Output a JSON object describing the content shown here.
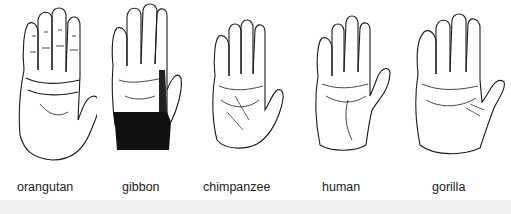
{
  "figure": {
    "hands": [
      {
        "id": "orangutan",
        "label": "orangutan",
        "x": 15,
        "label_x": 17
      },
      {
        "id": "gibbon",
        "label": "gibbon",
        "x": 105,
        "label_x": 122
      },
      {
        "id": "chimpanzee",
        "label": "chimpanzee",
        "x": 205,
        "label_x": 203
      },
      {
        "id": "human",
        "label": "human",
        "x": 308,
        "label_x": 322
      },
      {
        "id": "gorilla",
        "label": "gorilla",
        "x": 410,
        "label_x": 432
      }
    ],
    "colors": {
      "ink": "#1a1a1a",
      "background": "#ffffff",
      "strip": "#f0f0f0"
    }
  }
}
